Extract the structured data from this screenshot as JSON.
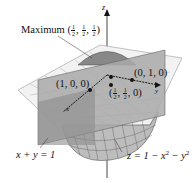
{
  "diagram": {
    "axes": {
      "z_label": "z",
      "x_label": "x",
      "y_label": "y"
    },
    "maximum_label": {
      "prefix": "Maximum",
      "coords": [
        "1/2",
        "1/2",
        "1/2"
      ]
    },
    "points": [
      {
        "label": "(1, 0, 0)"
      },
      {
        "label": "(0, 1, 0)"
      },
      {
        "label_fracs": [
          "1/2",
          "1/2"
        ],
        "label_tail": "0"
      }
    ],
    "plane_equation": "x + y = 1",
    "surface_equation": {
      "lhs": "z = 1 − x",
      "mid": " − y"
    },
    "colors": {
      "plane": "#a9a9a9",
      "plane_dark": "#8c8c8c",
      "surface": "#b5b5b5",
      "grid": "#9a9a9a",
      "axis": "#555555"
    }
  }
}
